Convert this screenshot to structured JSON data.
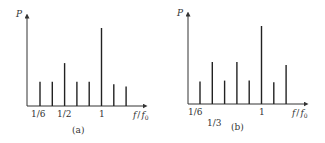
{
  "chart_data": [
    {
      "type": "bar",
      "subtype": "stem/line-spectrum",
      "panel_label": "(a)",
      "ylabel": "P",
      "xlabel": "f/f0",
      "xlabel_display": "f / f₀",
      "tick_labels": [
        {
          "text": "1/6",
          "at_index": 0
        },
        {
          "text": "1/2",
          "at_index": 2
        },
        {
          "text": "1",
          "at_index": 5
        }
      ],
      "x": [
        0.1667,
        0.3333,
        0.5,
        0.6667,
        0.8333,
        1.0,
        1.1667,
        1.3333
      ],
      "values": [
        0.31,
        0.31,
        0.55,
        0.31,
        0.31,
        1.0,
        0.28,
        0.25
      ],
      "grid": false,
      "legend": null
    },
    {
      "type": "bar",
      "subtype": "stem/line-spectrum",
      "panel_label": "(b)",
      "ylabel": "P",
      "xlabel": "f/f0",
      "xlabel_display": "f / f₀",
      "tick_labels": [
        {
          "text": "1/6",
          "at_index": 0
        },
        {
          "text": "1/3",
          "at_index": 1
        },
        {
          "text": "1",
          "at_index": 5
        }
      ],
      "x": [
        0.1667,
        0.3333,
        0.5,
        0.6667,
        0.8333,
        1.0,
        1.1667,
        1.3333
      ],
      "values": [
        0.29,
        0.54,
        0.3,
        0.54,
        0.3,
        1.0,
        0.28,
        0.5
      ],
      "grid": false,
      "legend": null
    }
  ],
  "panels": {
    "a": {
      "caption": "(a)",
      "ylabel": "P",
      "xlabel_f": "f",
      "xlabel_slash": "/",
      "xlabel_f0": "f",
      "xlabel_sub": "0",
      "ticks": [
        "1/6",
        "1/2",
        "1"
      ]
    },
    "b": {
      "caption": "(b)",
      "ylabel": "P",
      "xlabel_f": "f",
      "xlabel_slash": "/",
      "xlabel_f0": "f",
      "xlabel_sub": "0",
      "ticks": [
        "1/6",
        "1/3",
        "1"
      ]
    }
  },
  "colors": {
    "axis": "#333333",
    "stem": "#222222",
    "background": "#ffffff"
  }
}
